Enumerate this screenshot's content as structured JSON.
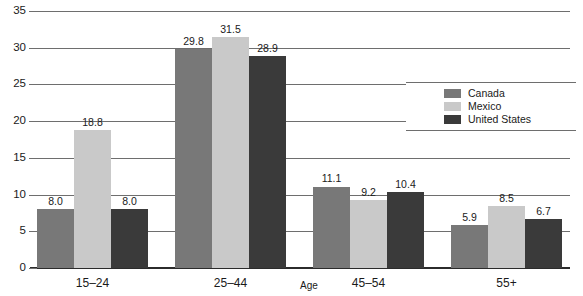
{
  "chart_data": {
    "type": "bar",
    "title": "",
    "xlabel": "Age",
    "ylabel": "",
    "categories": [
      "15–24",
      "25–44",
      "45–54",
      "55+"
    ],
    "series": [
      {
        "name": "Canada",
        "color": "#787878",
        "values": [
          8.0,
          29.8,
          11.1,
          5.9
        ]
      },
      {
        "name": "Mexico",
        "color": "#c9c9c9",
        "values": [
          18.8,
          31.5,
          9.2,
          8.5
        ]
      },
      {
        "name": "United States",
        "color": "#3a3a3a",
        "values": [
          8.0,
          28.9,
          10.4,
          6.7
        ]
      }
    ],
    "value_labels": [
      [
        "8.0",
        "18.8",
        "8.0"
      ],
      [
        "29.8",
        "31.5",
        "28.9"
      ],
      [
        "11.1",
        "9.2",
        "10.4"
      ],
      [
        "5.9",
        "8.5",
        "6.7"
      ]
    ],
    "ylim": [
      0,
      35
    ],
    "yticks": [
      0,
      5,
      10,
      15,
      20,
      25,
      30,
      35
    ],
    "ytick_labels": [
      "0",
      "5",
      "10",
      "15",
      "20",
      "25",
      "30",
      "35"
    ],
    "grid": true,
    "legend_position": "right",
    "legend_entries": [
      "Canada",
      "Mexico",
      "United States"
    ]
  }
}
